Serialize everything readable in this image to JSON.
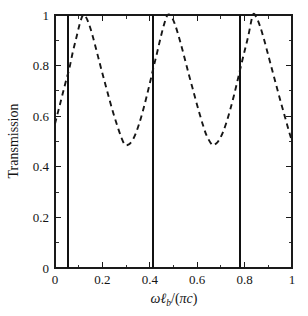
{
  "figure": {
    "background": "#ffffff",
    "plot_area": {
      "left": 55,
      "right": 292,
      "top": 15,
      "bottom": 268
    }
  },
  "chart_data": {
    "type": "line",
    "title": "",
    "subtitle": "",
    "xlabel": "ωℓ_b/(πc)",
    "ylabel": "Transmission",
    "xlim": [
      0,
      1
    ],
    "ylim": [
      0,
      1
    ],
    "grid": false,
    "legend": "none",
    "x_ticks": [
      0,
      0.2,
      0.4,
      0.6,
      0.8,
      1
    ],
    "x_tick_labels": [
      "0",
      "0.2",
      "0.4",
      "0.6",
      "0.8",
      "1"
    ],
    "x_minor_ticks": [
      0.1,
      0.3,
      0.5,
      0.7,
      0.9
    ],
    "y_ticks": [
      0,
      0.2,
      0.4,
      0.6,
      0.8,
      1
    ],
    "y_tick_labels": [
      "0",
      "0.2",
      "0.4",
      "0.6",
      "0.8",
      "1"
    ],
    "y_minor_ticks": [
      0.1,
      0.3,
      0.5,
      0.7,
      0.9
    ],
    "series": [
      {
        "name": "transmission",
        "style": "dashed",
        "color": "#161616",
        "x": [
          0.0,
          0.015,
          0.03,
          0.045,
          0.06,
          0.075,
          0.09,
          0.105,
          0.118,
          0.13,
          0.145,
          0.16,
          0.175,
          0.19,
          0.205,
          0.22,
          0.235,
          0.25,
          0.265,
          0.28,
          0.295,
          0.31,
          0.325,
          0.34,
          0.355,
          0.37,
          0.385,
          0.4,
          0.415,
          0.43,
          0.445,
          0.46,
          0.475,
          0.49,
          0.505,
          0.52,
          0.535,
          0.55,
          0.565,
          0.58,
          0.595,
          0.61,
          0.625,
          0.64,
          0.663,
          0.68,
          0.695,
          0.71,
          0.725,
          0.74,
          0.755,
          0.77,
          0.785,
          0.8,
          0.815,
          0.835,
          0.85,
          0.865,
          0.88,
          0.895,
          0.91,
          0.925,
          0.94,
          0.955,
          0.97,
          0.985,
          1.0
        ],
        "y": [
          0.57,
          0.625,
          0.68,
          0.735,
          0.787,
          0.853,
          0.91,
          0.967,
          1.0,
          0.993,
          0.96,
          0.913,
          0.86,
          0.805,
          0.752,
          0.7,
          0.648,
          0.6,
          0.556,
          0.516,
          0.487,
          0.488,
          0.502,
          0.53,
          0.57,
          0.618,
          0.672,
          0.73,
          0.79,
          0.848,
          0.908,
          0.962,
          1.0,
          0.995,
          0.966,
          0.922,
          0.872,
          0.818,
          0.764,
          0.712,
          0.66,
          0.61,
          0.563,
          0.523,
          0.487,
          0.492,
          0.51,
          0.54,
          0.58,
          0.628,
          0.682,
          0.74,
          0.8,
          0.858,
          0.915,
          1.0,
          0.99,
          0.956,
          0.91,
          0.858,
          0.805,
          0.752,
          0.7,
          0.648,
          0.598,
          0.548,
          0.5
        ],
        "peaks": [
          {
            "x": 0.118,
            "y": 1.0
          },
          {
            "x": 0.475,
            "y": 1.0
          },
          {
            "x": 0.835,
            "y": 1.0
          }
        ],
        "minima": [
          {
            "x": 0.295,
            "y": 0.487
          },
          {
            "x": 0.663,
            "y": 0.487
          }
        ],
        "endpoints": [
          {
            "x": 0.0,
            "y": 0.57
          },
          {
            "x": 1.0,
            "y": 0.5
          }
        ]
      }
    ],
    "vertical_lines": {
      "name": "resonance-lines",
      "style": "solid",
      "color": "#111111",
      "x": [
        0.055,
        0.413,
        0.78
      ],
      "y_span": [
        0,
        1
      ]
    }
  }
}
